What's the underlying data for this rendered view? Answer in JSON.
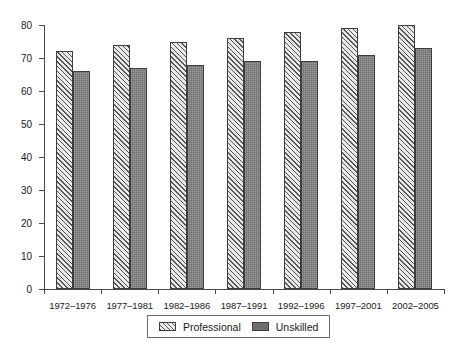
{
  "chart_data": {
    "type": "bar",
    "title": "",
    "xlabel": "",
    "ylabel": "",
    "ylim": [
      0,
      80
    ],
    "yticks": [
      0,
      10,
      20,
      30,
      40,
      50,
      60,
      70,
      80
    ],
    "grid": false,
    "legend_position": "bottom",
    "categories": [
      "1972–1976",
      "1977–1981",
      "1982–1986",
      "1987–1991",
      "1992–1996",
      "1997–2001",
      "2002–2005"
    ],
    "series": [
      {
        "name": "Professional",
        "pattern": "diagonal-hatch",
        "color": "#e9e9e9",
        "values": [
          72,
          74,
          75,
          76,
          78,
          79,
          80
        ]
      },
      {
        "name": "Unskilled",
        "pattern": "solid-dark",
        "color": "#6e6e6e",
        "values": [
          66,
          67,
          68,
          69,
          69,
          71,
          73
        ]
      }
    ]
  },
  "legend": {
    "entries": [
      {
        "label": "Professional"
      },
      {
        "label": "Unskilled"
      }
    ]
  }
}
